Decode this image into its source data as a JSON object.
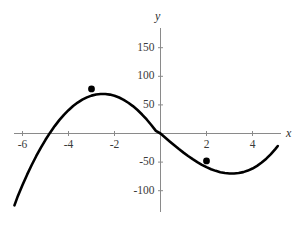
{
  "chart_data": {
    "type": "line",
    "title": "",
    "subtitle": "",
    "xlabel": "x",
    "ylabel": "y",
    "xlim": [
      -6.4,
      5.2
    ],
    "ylim": [
      -135,
      170
    ],
    "grid": false,
    "legend": null,
    "function_expression": "y = 2x^3 + 3x^2 - 36x",
    "x_ticks": [
      {
        "value": -6,
        "label": "-6"
      },
      {
        "value": -4,
        "label": "-4"
      },
      {
        "value": -2,
        "label": "-2"
      },
      {
        "value": 2,
        "label": "2"
      },
      {
        "value": 4,
        "label": "4"
      }
    ],
    "y_ticks": [
      {
        "value": 150,
        "label": "150"
      },
      {
        "value": 100,
        "label": "100"
      },
      {
        "value": 50,
        "label": "50"
      },
      {
        "value": -50,
        "label": "-50"
      },
      {
        "value": -100,
        "label": "-100"
      }
    ],
    "series": [
      {
        "name": "cubic-curve",
        "color": "#000000",
        "x": [
          -6.35,
          -6.2,
          -6.0,
          -5.8,
          -5.6,
          -5.4,
          -5.2,
          -5.0,
          -4.8,
          -4.6,
          -4.4,
          -4.2,
          -4.0,
          -3.8,
          -3.6,
          -3.4,
          -3.2,
          -3.0,
          -2.8,
          -2.6,
          -2.4,
          -2.2,
          -2.0,
          -1.8,
          -1.6,
          -1.4,
          -1.2,
          -1.0,
          -0.8,
          -0.6,
          -0.4,
          -0.2,
          0.0,
          0.2,
          0.4,
          0.6,
          0.8,
          1.0,
          1.2,
          1.4,
          1.6,
          1.8,
          2.0,
          2.2,
          2.4,
          2.6,
          2.8,
          3.0,
          3.2,
          3.4,
          3.6,
          3.8,
          4.0,
          4.2,
          4.4,
          4.6,
          4.8,
          5.0,
          5.1
        ],
        "y": [
          -125.6,
          -109.1,
          -90.0,
          -72.0,
          -55.1,
          -39.3,
          -24.6,
          -11.0,
          1.5,
          12.9,
          23.3,
          32.6,
          40.8,
          48.0,
          54.1,
          59.2,
          63.2,
          66.2,
          68.2,
          69.1,
          69.1,
          68.0,
          65.9,
          62.9,
          58.8,
          53.8,
          47.9,
          41.0,
          33.2,
          24.5,
          14.9,
          4.6,
          0.0,
          -6.9,
          -13.9,
          -20.6,
          -27.2,
          -33.4,
          -39.3,
          -44.9,
          -50.0,
          -54.7,
          -58.8,
          -62.4,
          -65.3,
          -67.6,
          -69.2,
          -70.0,
          -70.0,
          -69.2,
          -67.5,
          -64.8,
          -61.2,
          -56.5,
          -50.8,
          -44.0,
          -36.0,
          -26.9,
          -21.9
        ]
      }
    ],
    "marked_points": [
      {
        "name": "local-maximum",
        "x": -3,
        "y": 78,
        "label": ""
      },
      {
        "name": "local-minimum",
        "x": 2,
        "y": -48,
        "label": ""
      }
    ],
    "axis_color": "#808080",
    "curve_color": "#000000",
    "point_color": "#000000",
    "background_color": "#ffffff"
  }
}
